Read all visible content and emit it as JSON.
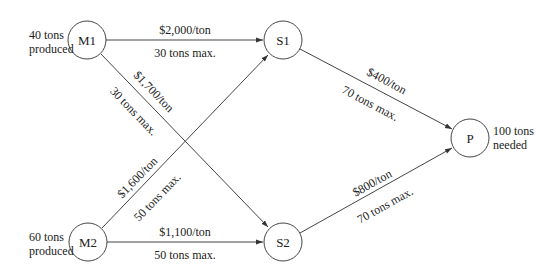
{
  "diagram": {
    "type": "network-flow",
    "nodes": {
      "M1": {
        "label": "M1",
        "x": 87,
        "y": 40,
        "note_line1": "40 tons",
        "note_line2": "produced"
      },
      "M2": {
        "label": "M2",
        "x": 88,
        "y": 242,
        "note_line1": "60 tons",
        "note_line2": "produced"
      },
      "S1": {
        "label": "S1",
        "x": 283,
        "y": 40
      },
      "S2": {
        "label": "S2",
        "x": 283,
        "y": 242
      },
      "P": {
        "label": "P",
        "x": 470,
        "y": 138,
        "note_line1": "100 tons",
        "note_line2": "needed"
      }
    },
    "edges": {
      "M1_S1": {
        "from": "M1",
        "to": "S1",
        "cost": "$2,000/ton",
        "capacity": "30 tons max."
      },
      "M1_S2": {
        "from": "M1",
        "to": "S2",
        "cost": "$1,700/ton",
        "capacity": "30 tons max."
      },
      "M2_S1": {
        "from": "M2",
        "to": "S1",
        "cost": "$1,600/ton",
        "capacity": "50 tons max."
      },
      "M2_S2": {
        "from": "M2",
        "to": "S2",
        "cost": "$1,100/ton",
        "capacity": "50 tons max."
      },
      "S1_P": {
        "from": "S1",
        "to": "P",
        "cost": "$400/ton",
        "capacity": "70 tons max."
      },
      "S2_P": {
        "from": "S2",
        "to": "P",
        "cost": "$800/ton",
        "capacity": "70 tons max."
      }
    },
    "colors": {
      "stroke": "#444444",
      "text": "#222222",
      "background": "#ffffff"
    }
  }
}
